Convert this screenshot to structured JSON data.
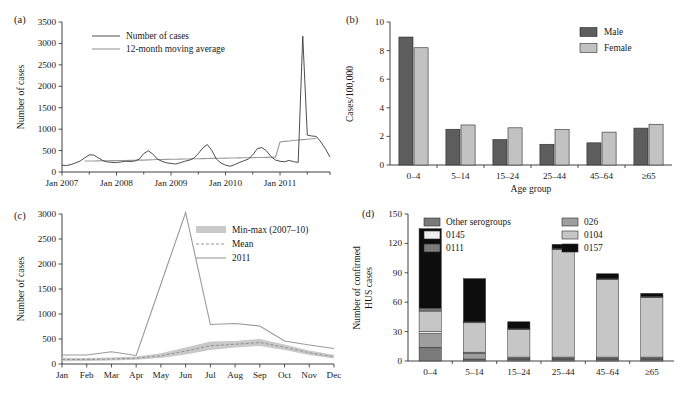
{
  "figure": {
    "panels": [
      "(a)",
      "(b)",
      "(c)",
      "(d)"
    ]
  },
  "chart_data": [
    {
      "panel": "(a)",
      "type": "line",
      "title": "",
      "xlabel": "",
      "ylabel": "Number of cases",
      "ylim": [
        0,
        3500
      ],
      "yticks": [
        0,
        500,
        1000,
        1500,
        2000,
        2500,
        3000,
        3500
      ],
      "xticks": [
        "Jan 2007",
        "Jan 2008",
        "Jan 2009",
        "Jan 2010",
        "Jan 2011"
      ],
      "grid": false,
      "legend_position": "top-center",
      "series": [
        {
          "name": "Number of cases",
          "color": "#3a3a3a",
          "values": [
            160,
            150,
            175,
            215,
            255,
            330,
            400,
            395,
            330,
            265,
            235,
            225,
            220,
            235,
            250,
            245,
            255,
            300,
            430,
            495,
            420,
            300,
            250,
            215,
            200,
            185,
            215,
            250,
            275,
            320,
            430,
            560,
            640,
            500,
            300,
            210,
            160,
            135,
            170,
            220,
            260,
            300,
            400,
            545,
            570,
            495,
            360,
            280,
            250,
            240,
            270,
            240,
            225,
            3170,
            860,
            840,
            830,
            700,
            540,
            350
          ]
        },
        {
          "name": "12-month moving average",
          "color": "#9a9a9a",
          "values": [
            null,
            null,
            null,
            null,
            null,
            255,
            256,
            258,
            260,
            262,
            264,
            265,
            266,
            268,
            270,
            272,
            274,
            276,
            278,
            282,
            286,
            290,
            292,
            294,
            296,
            298,
            300,
            302,
            305,
            308,
            310,
            312,
            315,
            318,
            320,
            322,
            324,
            326,
            328,
            330,
            332,
            334,
            336,
            338,
            340,
            342,
            344,
            346,
            700,
            715,
            725,
            735,
            745,
            755,
            765,
            775,
            780,
            null,
            null,
            null
          ]
        }
      ]
    },
    {
      "panel": "(b)",
      "type": "bar",
      "title": "",
      "xlabel": "Age group",
      "ylabel": "Cases/100,000",
      "ylim": [
        0,
        10
      ],
      "yticks": [
        0,
        2,
        4,
        6,
        8,
        10
      ],
      "categories": [
        "0–4",
        "5–14",
        "15–24",
        "25–44",
        "45–64",
        "≥65"
      ],
      "grid": false,
      "legend_position": "top-right",
      "series": [
        {
          "name": "Male",
          "color": "#5d5d5d",
          "values": [
            8.95,
            2.5,
            1.78,
            1.45,
            1.55,
            2.58
          ]
        },
        {
          "name": "Female",
          "color": "#c2c2c2",
          "values": [
            8.2,
            2.8,
            2.6,
            2.48,
            2.3,
            2.85
          ]
        }
      ]
    },
    {
      "panel": "(c)",
      "type": "line",
      "title": "",
      "xlabel": "",
      "ylabel": "Number of cases",
      "ylim": [
        0,
        3000
      ],
      "yticks": [
        0,
        500,
        1000,
        1500,
        2000,
        2500,
        3000
      ],
      "categories": [
        "Jan",
        "Feb",
        "Mar",
        "Apr",
        "May",
        "Jun",
        "Jul",
        "Aug",
        "Sep",
        "Oct",
        "Nov",
        "Dec"
      ],
      "grid": false,
      "legend_position": "top-right",
      "series": [
        {
          "name": "Min-max (2007–10)",
          "kind": "band",
          "color": "#c9c9c9",
          "min": [
            55,
            60,
            70,
            85,
            120,
            190,
            280,
            330,
            360,
            280,
            180,
            110
          ],
          "max": [
            125,
            120,
            130,
            150,
            215,
            330,
            450,
            460,
            500,
            390,
            270,
            185
          ]
        },
        {
          "name": "Mean",
          "kind": "dashed",
          "color": "#8a8a8a",
          "values": [
            90,
            90,
            100,
            115,
            165,
            260,
            365,
            395,
            430,
            335,
            225,
            145
          ]
        },
        {
          "name": "2011",
          "kind": "solid",
          "color": "#8a8a8a",
          "values": [
            180,
            180,
            245,
            170,
            1600,
            3030,
            790,
            810,
            760,
            460,
            380,
            310
          ]
        }
      ]
    },
    {
      "panel": "(d)",
      "type": "bar",
      "stacked": true,
      "title": "",
      "xlabel": "",
      "ylabel": "Number of confirmed HUS cases",
      "ylim": [
        0,
        150
      ],
      "yticks": [
        0,
        30,
        60,
        90,
        120,
        150
      ],
      "categories": [
        "0–4",
        "5–14",
        "15–24",
        "25–44",
        "45–64",
        "≥65"
      ],
      "grid": false,
      "legend_position": "top",
      "series": [
        {
          "name": "Other serogroups",
          "color": "#7a7a7a",
          "values": [
            14,
            2,
            2,
            2,
            2,
            2
          ]
        },
        {
          "name": "026",
          "color": "#9e9e9e",
          "values": [
            14,
            6,
            1,
            1,
            1,
            1
          ]
        },
        {
          "name": "0145",
          "color": "#ededed",
          "values": [
            2,
            1,
            1,
            1,
            1,
            1
          ]
        },
        {
          "name": "0104",
          "color": "#c6c6c6",
          "values": [
            21,
            30,
            28,
            110,
            79,
            61
          ]
        },
        {
          "name": "0111",
          "color": "#7a7a7a",
          "values": [
            3,
            1,
            1,
            1,
            1,
            1
          ]
        },
        {
          "name": "0157",
          "color": "#0d0d0d",
          "values": [
            81,
            44,
            7,
            4,
            5,
            3
          ]
        }
      ]
    }
  ]
}
